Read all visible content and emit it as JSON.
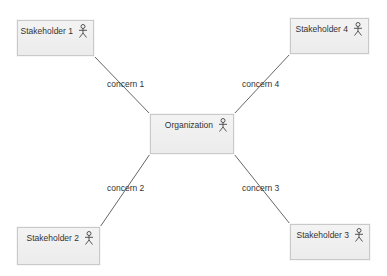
{
  "diagram": {
    "colors": {
      "node_fill": "#efefef",
      "node_border": "#c9c9c9",
      "line": "#666666",
      "text": "#333333"
    },
    "nodes": [
      {
        "id": "stakeholder1",
        "label": "Stakeholder 1",
        "icon": "actor-icon",
        "x": 17,
        "y": 20,
        "w": 77,
        "h": 36
      },
      {
        "id": "stakeholder4",
        "label": "Stakeholder 4",
        "icon": "actor-icon",
        "x": 290,
        "y": 18,
        "w": 79,
        "h": 36
      },
      {
        "id": "organization",
        "label": "Organization",
        "icon": "actor-icon",
        "x": 150,
        "y": 114,
        "w": 84,
        "h": 40
      },
      {
        "id": "stakeholder2",
        "label": "Stakeholder 2",
        "icon": "actor-icon",
        "x": 17,
        "y": 227,
        "w": 83,
        "h": 38
      },
      {
        "id": "stakeholder3",
        "label": "Stakeholder 3",
        "icon": "actor-icon",
        "x": 290,
        "y": 224,
        "w": 80,
        "h": 36
      }
    ],
    "edges": [
      {
        "from": "stakeholder1",
        "to": "organization",
        "label": "concern 1"
      },
      {
        "from": "stakeholder4",
        "to": "organization",
        "label": "concern 4"
      },
      {
        "from": "organization",
        "to": "stakeholder2",
        "label": "concern 2"
      },
      {
        "from": "organization",
        "to": "stakeholder3",
        "label": "concern 3"
      }
    ]
  }
}
